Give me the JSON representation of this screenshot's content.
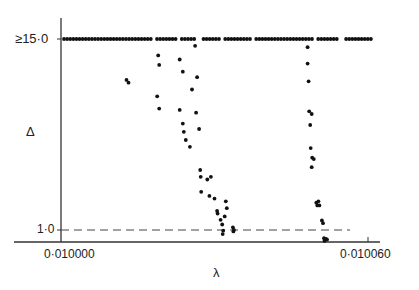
{
  "chart_data": {
    "type": "scatter",
    "title": "",
    "xlabel": "λ",
    "ylabel": "Δ",
    "x_tick_labels": [
      "0·010000",
      "0·010060"
    ],
    "y_tick_labels": [
      "≥15·0",
      "1·0"
    ],
    "xlim": [
      0.01,
      0.01006
    ],
    "ylim": [
      1.0,
      15.0
    ],
    "reference_line": {
      "y": 1.0,
      "style": "dashed"
    },
    "saturated_row": {
      "y": 15.0,
      "label": "≥15·0",
      "x_start": 0.0100015,
      "x_end": 0.0100598,
      "note": "dense row of points at Δ ≥ 15·0 across λ range with small gaps"
    },
    "points": [
      {
        "x": 0.0100128,
        "y": 12.0
      },
      {
        "x": 0.0100132,
        "y": 11.8
      },
      {
        "x": 0.010019,
        "y": 13.8
      },
      {
        "x": 0.0100192,
        "y": 13.1
      },
      {
        "x": 0.0100188,
        "y": 10.8
      },
      {
        "x": 0.0100192,
        "y": 9.9
      },
      {
        "x": 0.0100232,
        "y": 13.5
      },
      {
        "x": 0.0100238,
        "y": 12.6
      },
      {
        "x": 0.0100232,
        "y": 9.8
      },
      {
        "x": 0.0100238,
        "y": 8.8
      },
      {
        "x": 0.010024,
        "y": 8.2
      },
      {
        "x": 0.0100244,
        "y": 7.6
      },
      {
        "x": 0.0100252,
        "y": 7.1
      },
      {
        "x": 0.0100256,
        "y": 11.3
      },
      {
        "x": 0.0100262,
        "y": 14.5
      },
      {
        "x": 0.0100266,
        "y": 12.2
      },
      {
        "x": 0.0100264,
        "y": 9.6
      },
      {
        "x": 0.010027,
        "y": 8.4
      },
      {
        "x": 0.0100272,
        "y": 5.4
      },
      {
        "x": 0.0100273,
        "y": 4.9
      },
      {
        "x": 0.0100274,
        "y": 3.8
      },
      {
        "x": 0.0100286,
        "y": 4.7
      },
      {
        "x": 0.0100293,
        "y": 4.9
      },
      {
        "x": 0.010029,
        "y": 3.5
      },
      {
        "x": 0.01003,
        "y": 3.3
      },
      {
        "x": 0.0100305,
        "y": 2.4
      },
      {
        "x": 0.0100306,
        "y": 2.2
      },
      {
        "x": 0.0100312,
        "y": 1.75
      },
      {
        "x": 0.0100315,
        "y": 1.4
      },
      {
        "x": 0.0100317,
        "y": 0.95
      },
      {
        "x": 0.0100316,
        "y": 0.7
      },
      {
        "x": 0.010032,
        "y": 2.0
      },
      {
        "x": 0.0100324,
        "y": 2.6
      },
      {
        "x": 0.0100322,
        "y": 3.1
      },
      {
        "x": 0.0100336,
        "y": 1.2
      },
      {
        "x": 0.0100338,
        "y": 1.0
      },
      {
        "x": 0.0100337,
        "y": 0.9
      },
      {
        "x": 0.0100482,
        "y": 14.4
      },
      {
        "x": 0.0100482,
        "y": 13.2
      },
      {
        "x": 0.0100484,
        "y": 11.9
      },
      {
        "x": 0.0100485,
        "y": 9.7
      },
      {
        "x": 0.0100487,
        "y": 8.7
      },
      {
        "x": 0.010049,
        "y": 9.5
      },
      {
        "x": 0.0100488,
        "y": 7.0
      },
      {
        "x": 0.0100491,
        "y": 6.3
      },
      {
        "x": 0.010049,
        "y": 5.6
      },
      {
        "x": 0.0100494,
        "y": 6.2
      },
      {
        "x": 0.0100499,
        "y": 3.0
      },
      {
        "x": 0.0100501,
        "y": 2.8
      },
      {
        "x": 0.0100503,
        "y": 3.1
      },
      {
        "x": 0.0100505,
        "y": 2.8
      },
      {
        "x": 0.010051,
        "y": 1.7
      },
      {
        "x": 0.0100512,
        "y": 1.5
      },
      {
        "x": 0.0100514,
        "y": 0.4
      },
      {
        "x": 0.0100515,
        "y": 0.2
      },
      {
        "x": 0.0100516,
        "y": 0.3
      },
      {
        "x": 0.0100518,
        "y": 0.35
      },
      {
        "x": 0.010052,
        "y": 0.3
      }
    ],
    "grid": false,
    "legend": null
  },
  "axes": {
    "x_label": "λ",
    "y_label": "Δ",
    "x_ticks": [
      "0·010000",
      "0·010060"
    ],
    "y_ticks": [
      "≥15·0",
      "1·0"
    ]
  }
}
